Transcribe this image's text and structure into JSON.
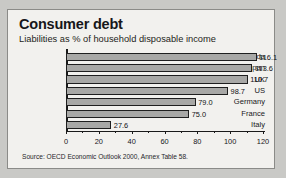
{
  "figure": {
    "title": "Consumer debt",
    "subtitle": "Liabilities as % of household disposable income",
    "source": "Source: OECD Economic Outlook 2000, Annex Table 58.",
    "bar_fill": "#a8a8a6",
    "bar_border": "#1f1f1f",
    "panel_bg": "#f2f1ee",
    "page_bg": "#c9c9c6"
  },
  "chart_data": {
    "type": "bar",
    "orientation": "horizontal",
    "title": "Consumer debt",
    "subtitle": "Liabilities as % of household disposable income",
    "categories": [
      "Canada",
      "Japan",
      "UK",
      "US",
      "Germany",
      "France",
      "Italy"
    ],
    "values": [
      116.1,
      113.6,
      110.7,
      98.7,
      79.0,
      75.0,
      27.6
    ],
    "value_labels": [
      "116.1",
      "113.6",
      "110.7",
      "98.7",
      "79.0",
      "75.0",
      "27.6"
    ],
    "xlabel": "",
    "ylabel": "",
    "xlim": [
      0,
      120
    ],
    "xticks": [
      0,
      20,
      40,
      60,
      80,
      100,
      120
    ],
    "xtick_labels": [
      "0",
      "20",
      "40",
      "60",
      "80",
      "100",
      "120"
    ],
    "grid": false,
    "legend": false,
    "source": "Source: OECD Economic Outlook 2000, Annex Table 58."
  }
}
